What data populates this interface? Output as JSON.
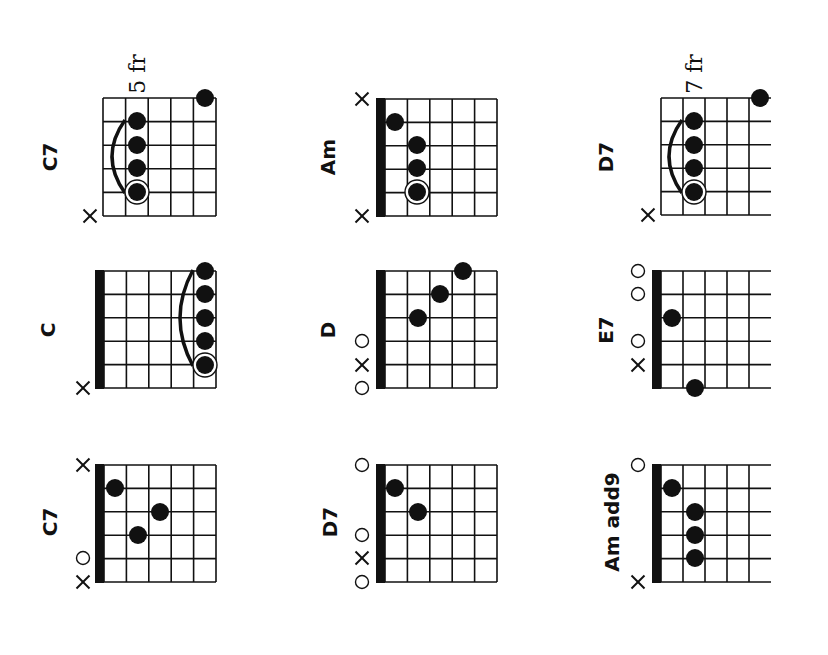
{
  "colors": {
    "ink": "#111111",
    "paper": "#ffffff"
  },
  "chords": [
    {
      "id": "r1c1",
      "name": "C7",
      "fret_label": "5 fr",
      "nut": false,
      "open_right": false,
      "grid": {
        "x": 103,
        "y": 98,
        "w": 113,
        "h": 118
      },
      "label_pos": {
        "x": 50,
        "y": 157
      },
      "fret_label_pos": {
        "x": 137,
        "y": 74
      },
      "dots": [
        {
          "x": 205,
          "y": 98
        },
        {
          "x": 137,
          "y": 121
        },
        {
          "x": 137,
          "y": 145
        },
        {
          "x": 137,
          "y": 168
        },
        {
          "x": 137,
          "y": 192,
          "root": true
        }
      ],
      "barre": {
        "x": 137,
        "y1": 121,
        "y2": 192
      },
      "markers": [
        {
          "type": "x",
          "x": 90,
          "y": 216
        }
      ]
    },
    {
      "id": "r1c2",
      "name": "Am",
      "fret_label": "",
      "nut": true,
      "open_right": false,
      "grid": {
        "x": 385,
        "y": 99,
        "w": 112,
        "h": 117
      },
      "label_pos": {
        "x": 328,
        "y": 157
      },
      "dots": [
        {
          "x": 395,
          "y": 122
        },
        {
          "x": 417,
          "y": 145
        },
        {
          "x": 417,
          "y": 168
        },
        {
          "x": 417,
          "y": 192,
          "root": true
        }
      ],
      "markers": [
        {
          "type": "x",
          "x": 362,
          "y": 99
        },
        {
          "type": "x",
          "x": 362,
          "y": 216
        }
      ]
    },
    {
      "id": "r1c3",
      "name": "D7",
      "fret_label": "7 fr",
      "nut": false,
      "open_right": true,
      "grid": {
        "x": 661,
        "y": 98,
        "w": 110,
        "h": 117
      },
      "label_pos": {
        "x": 606,
        "y": 157
      },
      "fret_label_pos": {
        "x": 694,
        "y": 74
      },
      "dots": [
        {
          "x": 760,
          "y": 98
        },
        {
          "x": 694,
          "y": 121
        },
        {
          "x": 694,
          "y": 145
        },
        {
          "x": 694,
          "y": 168
        },
        {
          "x": 694,
          "y": 192,
          "root": true
        }
      ],
      "barre": {
        "x": 694,
        "y1": 121,
        "y2": 192
      },
      "markers": [
        {
          "type": "x",
          "x": 648,
          "y": 215
        }
      ]
    },
    {
      "id": "r2c1",
      "name": "C",
      "fret_label": "",
      "nut": true,
      "open_right": false,
      "grid": {
        "x": 104,
        "y": 271,
        "w": 112,
        "h": 117
      },
      "label_pos": {
        "x": 48,
        "y": 330
      },
      "dots": [
        {
          "x": 205,
          "y": 271
        },
        {
          "x": 205,
          "y": 294
        },
        {
          "x": 205,
          "y": 318
        },
        {
          "x": 205,
          "y": 341
        },
        {
          "x": 205,
          "y": 365,
          "root": true
        }
      ],
      "barre": {
        "x": 205,
        "y1": 271,
        "y2": 365
      },
      "markers": [
        {
          "type": "x",
          "x": 83,
          "y": 388
        }
      ]
    },
    {
      "id": "r2c2",
      "name": "D",
      "fret_label": "",
      "nut": true,
      "open_right": false,
      "grid": {
        "x": 385,
        "y": 271,
        "w": 112,
        "h": 117
      },
      "label_pos": {
        "x": 328,
        "y": 330
      },
      "dots": [
        {
          "x": 463,
          "y": 271
        },
        {
          "x": 440,
          "y": 294
        },
        {
          "x": 418,
          "y": 318
        }
      ],
      "markers": [
        {
          "type": "o",
          "x": 362,
          "y": 341
        },
        {
          "type": "x",
          "x": 362,
          "y": 365
        },
        {
          "type": "o",
          "x": 362,
          "y": 388
        }
      ]
    },
    {
      "id": "r2c3",
      "name": "E7",
      "fret_label": "",
      "nut": true,
      "open_right": true,
      "grid": {
        "x": 661,
        "y": 271,
        "w": 110,
        "h": 117
      },
      "label_pos": {
        "x": 606,
        "y": 330
      },
      "dots": [
        {
          "x": 672,
          "y": 318
        },
        {
          "x": 695,
          "y": 388
        }
      ],
      "markers": [
        {
          "type": "o",
          "x": 638,
          "y": 271
        },
        {
          "type": "o",
          "x": 638,
          "y": 294
        },
        {
          "type": "o",
          "x": 638,
          "y": 341
        },
        {
          "type": "x",
          "x": 638,
          "y": 365
        }
      ]
    },
    {
      "id": "r3c1",
      "name": "C7",
      "fret_label": "",
      "nut": true,
      "open_right": false,
      "grid": {
        "x": 104,
        "y": 465,
        "w": 112,
        "h": 117
      },
      "label_pos": {
        "x": 50,
        "y": 522
      },
      "dots": [
        {
          "x": 115,
          "y": 488
        },
        {
          "x": 160,
          "y": 512
        },
        {
          "x": 138,
          "y": 535
        }
      ],
      "markers": [
        {
          "type": "x",
          "x": 83,
          "y": 465
        },
        {
          "type": "o",
          "x": 83,
          "y": 558
        },
        {
          "type": "x",
          "x": 83,
          "y": 582
        }
      ]
    },
    {
      "id": "r3c2",
      "name": "D7",
      "fret_label": "",
      "nut": true,
      "open_right": false,
      "grid": {
        "x": 385,
        "y": 465,
        "w": 112,
        "h": 117
      },
      "label_pos": {
        "x": 330,
        "y": 522
      },
      "dots": [
        {
          "x": 395,
          "y": 488
        },
        {
          "x": 418,
          "y": 512
        }
      ],
      "markers": [
        {
          "type": "o",
          "x": 362,
          "y": 465
        },
        {
          "type": "o",
          "x": 362,
          "y": 535
        },
        {
          "type": "x",
          "x": 362,
          "y": 558
        },
        {
          "type": "o",
          "x": 362,
          "y": 582
        }
      ]
    },
    {
      "id": "r3c3",
      "name": "Am add9",
      "fret_label": "",
      "nut": true,
      "open_right": true,
      "grid": {
        "x": 661,
        "y": 465,
        "w": 110,
        "h": 117
      },
      "label_pos": {
        "x": 612,
        "y": 522
      },
      "dots": [
        {
          "x": 672,
          "y": 488
        },
        {
          "x": 695,
          "y": 512
        },
        {
          "x": 695,
          "y": 535
        },
        {
          "x": 695,
          "y": 558
        }
      ],
      "markers": [
        {
          "type": "o",
          "x": 638,
          "y": 465
        },
        {
          "type": "x",
          "x": 638,
          "y": 582
        }
      ]
    }
  ]
}
